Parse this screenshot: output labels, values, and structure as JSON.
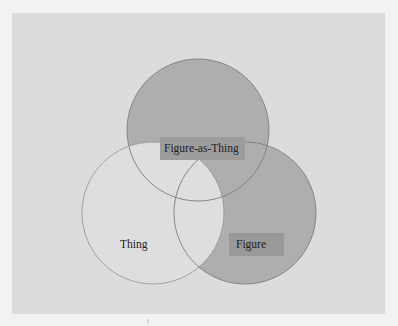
{
  "diagram": {
    "type": "venn",
    "sets": [
      {
        "id": "figure-as-thing",
        "label": "Figure-as-Thing",
        "cx": 198,
        "cy": 130,
        "r": 71
      },
      {
        "id": "thing",
        "label": "Thing",
        "cx": 153,
        "cy": 213,
        "r": 71
      },
      {
        "id": "figure",
        "label": "Figure",
        "cx": 245,
        "cy": 213,
        "r": 71
      }
    ],
    "colors": {
      "page_bg": "#f2f2f2",
      "panel_bg": "#dcdcdc",
      "shaded_fill": "#aeaeae",
      "light_fill": "#dedede",
      "outline": "#8a8a8a",
      "label_box": "#9c9c9c",
      "label_text": "#222222"
    },
    "labels": {
      "figure_as_thing": "Figure-as-Thing",
      "thing": "Thing",
      "figure": "Figure"
    }
  }
}
